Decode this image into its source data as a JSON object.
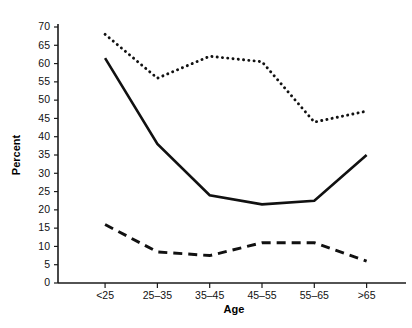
{
  "chart_data": {
    "type": "line",
    "title": "",
    "xlabel": "Age",
    "ylabel": "Percent",
    "categories": [
      "<25",
      "25–35",
      "35–45",
      "45–55",
      "55–65",
      ">65"
    ],
    "ylim": [
      0,
      70
    ],
    "xlim": [
      0,
      5
    ],
    "yticks": [
      0,
      5,
      10,
      15,
      20,
      25,
      30,
      35,
      40,
      45,
      50,
      55,
      60,
      65,
      70
    ],
    "ytick_labels": [
      "0",
      "5",
      "10",
      "15",
      "20",
      "25",
      "30",
      "35",
      "40",
      "45",
      "50",
      "55",
      "60",
      "65",
      "70"
    ],
    "grid": false,
    "legend": null,
    "legend_position": "none",
    "series": [
      {
        "name": "dotted-series",
        "style": "dotted",
        "color": "#111111",
        "values": [
          68,
          56,
          62,
          60.5,
          44,
          47
        ]
      },
      {
        "name": "solid-series",
        "style": "solid",
        "color": "#111111",
        "values": [
          61.5,
          38,
          24,
          21.5,
          22.5,
          35
        ]
      },
      {
        "name": "dashed-series",
        "style": "dashed",
        "color": "#111111",
        "values": [
          16,
          8.5,
          7.5,
          11,
          11,
          6
        ]
      }
    ]
  },
  "axes": {
    "y_title": "Percent",
    "x_title": "Age"
  }
}
